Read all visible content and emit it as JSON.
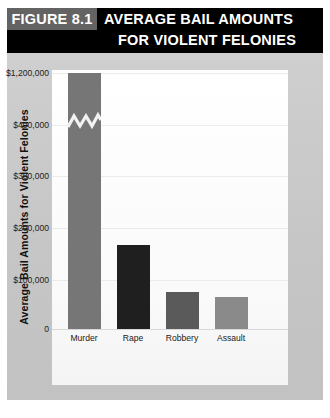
{
  "figure": {
    "number_label": "FIGURE 8.1",
    "title_line_1": "AVERAGE BAIL AMOUNTS",
    "title_line_2": "FOR VIOLENT FELONIES",
    "header_background": "#000000",
    "number_box_background": "#636363",
    "body_background": "#c9c9c9",
    "panel_background": "#fdfdfd"
  },
  "caption": {
    "text": ""
  },
  "chart_data": {
    "type": "bar",
    "title": "AVERAGE BAIL AMOUNTS FOR VIOLENT FELONIES",
    "xlabel": "",
    "ylabel": "Average Bail Amounts for Violent Felonies",
    "categories": [
      "Murder",
      "Rape",
      "Robbery",
      "Assault"
    ],
    "values": [
      1200000,
      165000,
      73000,
      62000
    ],
    "value_labels": [
      "$1,200,000",
      "$165,000",
      "$73,000",
      "$62,000"
    ],
    "bar_colors": [
      "#767676",
      "#1f1f1f",
      "#5a5a5a",
      "#8a8a8a"
    ],
    "ytick_labels": [
      "$1,200,000",
      "$400,000",
      "$300,000",
      "$200,000",
      "$100,000",
      "0"
    ],
    "ytick_values": [
      1200000,
      400000,
      300000,
      200000,
      100000,
      0
    ],
    "ylim": [
      0,
      1200000
    ],
    "axis_break": true,
    "axis_break_note": "Y-axis is broken between $400,000 and $1,200,000; the Murder bar is drawn with a zigzag break mark.",
    "grid": true,
    "grid_axis": "y",
    "legend": false,
    "legend_position": "none"
  }
}
